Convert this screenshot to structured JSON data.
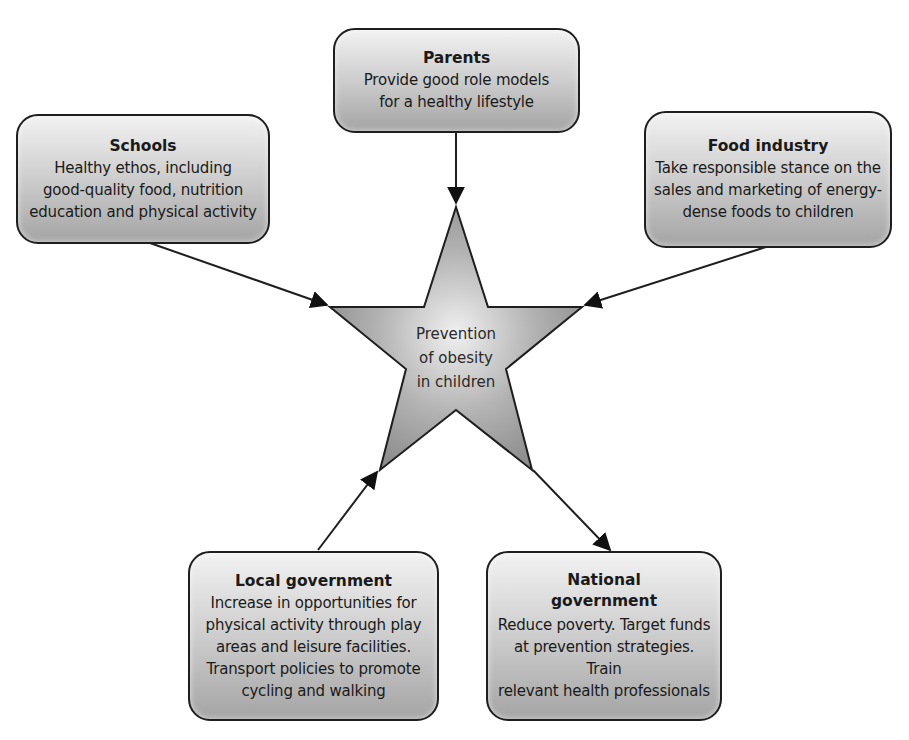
{
  "center": {
    "lines": [
      "Prevention",
      "of obesity",
      "in children"
    ]
  },
  "nodes": {
    "parents": {
      "title": "Parents",
      "lines": [
        "Provide good role models",
        "for a healthy lifestyle"
      ]
    },
    "schools": {
      "title": "Schools",
      "lines": [
        "Healthy ethos, including",
        "good-quality food, nutrition",
        "education and physical activity"
      ]
    },
    "food_industry": {
      "title": "Food industry",
      "lines": [
        "Take responsible stance on the",
        "sales and marketing of energy-",
        "dense foods to children"
      ]
    },
    "local_government": {
      "title": "Local government",
      "lines": [
        "Increase in opportunities for",
        "physical activity through play",
        "areas and leisure facilities.",
        "Transport policies to promote",
        "cycling and walking"
      ]
    },
    "national_government": {
      "title_lines": [
        "National",
        "government"
      ],
      "lines": [
        "Reduce poverty. Target funds",
        "at prevention strategies. Train",
        "relevant health professionals"
      ]
    }
  },
  "colors": {
    "stroke": "#1e1e1e",
    "box_top": "#f2f2f2",
    "box_bottom": "#a4a4a4",
    "star_center": "#f0f0f0",
    "star_edge": "#8e8e8e"
  }
}
